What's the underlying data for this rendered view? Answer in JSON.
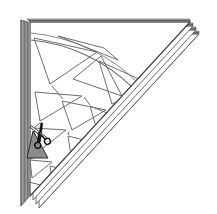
{
  "figure": {
    "title": "Folded paper cutting diagram",
    "caption": "Stack of folded sheets cut into a right triangle with radial triangular cut-outs and scissors",
    "width": 217,
    "height": 214,
    "background_color": "#ffffff"
  },
  "colors": {
    "outline": "#3a3a3a",
    "pattern_line": "#6e6e6e",
    "edge_stack": "#7a7a7a",
    "edge_stack_dark": "#4a4a4a",
    "shaded_triangle": "#8c8c8c",
    "scissors_dark": "#1a1a1a",
    "scissors_light": "#f2f2f2",
    "paper_fill": "#ffffff"
  },
  "paper_stack": {
    "label": "Stack of folded paper sheets",
    "sheet_count": 4,
    "sheets": [
      {
        "name": "sheet-1-top",
        "offset_x": 0,
        "offset_y": 0
      },
      {
        "name": "sheet-2",
        "offset_x": 3,
        "offset_y": 4
      },
      {
        "name": "sheet-3",
        "offset_x": 6,
        "offset_y": 8
      },
      {
        "name": "sheet-4-bottom",
        "offset_x": 9,
        "offset_y": 12
      }
    ],
    "triangle_vertices": {
      "top_left": [
        30,
        22
      ],
      "top_right": [
        190,
        22
      ],
      "bottom_left": [
        30,
        196
      ]
    }
  },
  "fold_edge": {
    "label": "Folded spine along left edge",
    "x_outer": 21,
    "x_inner": 28,
    "y_top": 20,
    "y_bottom": 206
  },
  "cut_pattern": {
    "label": "Radial triangular cut-out pattern",
    "arc": {
      "name": "quarter-arc",
      "center": [
        20,
        205
      ],
      "radius": 174,
      "start_angle_deg": 0,
      "end_angle_deg": 90
    },
    "triangles": [
      {
        "name": "cutout-1",
        "points": "34,38 97,52 50,84"
      },
      {
        "name": "cutout-2",
        "points": "58,36 118,60 104,48"
      },
      {
        "name": "cutout-3",
        "points": "101,56 122,96 73,79"
      },
      {
        "name": "cutout-4",
        "points": "99,61 150,84 112,104"
      },
      {
        "name": "cutout-5",
        "points": "35,92 82,96 40,121"
      },
      {
        "name": "cutout-6",
        "points": "62,101 106,110 72,130"
      },
      {
        "name": "cutout-7",
        "points": "90,106 134,124 99,137"
      },
      {
        "name": "cutout-8",
        "points": "34,128 66,130 38,152"
      },
      {
        "name": "cutout-9",
        "points": "68,136 100,144 72,162"
      },
      {
        "name": "cutout-10",
        "points": "30,160 52,162 32,178"
      },
      {
        "name": "cutout-11",
        "points": "50,166 74,172 53,186"
      },
      {
        "name": "cutout-12",
        "points": "29,182 44,186 30,196"
      }
    ],
    "active_triangle": {
      "name": "triangle-being-cut",
      "points": "33,131 48,158 27,158",
      "fill": "#8c8c8c",
      "label": "Triangle currently being cut out"
    }
  },
  "scissors": {
    "label": "Scissors cutting the shaded triangle",
    "position": {
      "x": 28,
      "y": 128
    },
    "blade_angle_deg": -30,
    "handle_ring_radius": 3.2
  },
  "annotations": {
    "element_names": [
      "paper-stack",
      "fold-edge",
      "cut-pattern",
      "scissors-icon"
    ]
  }
}
